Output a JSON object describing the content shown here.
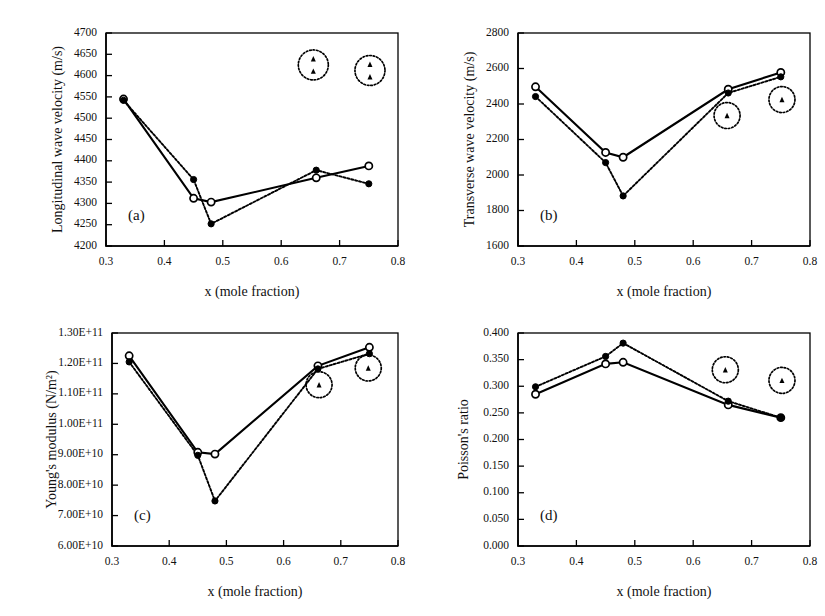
{
  "figure": {
    "background": "#ffffff",
    "ink_color": "#000000",
    "panel_count": 4
  },
  "chart_data": [
    {
      "id": "panel-a",
      "type": "line",
      "panel_label": "(a)",
      "title": "",
      "xlabel": "x (mole fraction)",
      "ylabel": "Longitudinal wave velocity (m/s)",
      "xlim": [
        0.3,
        0.8
      ],
      "ylim": [
        4200,
        4700
      ],
      "xticks": [
        0.3,
        0.4,
        0.5,
        0.6,
        0.7,
        0.8
      ],
      "xtick_labels": [
        "0.3",
        "0.4",
        "0.5",
        "0.6",
        "0.7",
        "0.8"
      ],
      "yticks": [
        4200,
        4250,
        4300,
        4350,
        4400,
        4450,
        4500,
        4550,
        4600,
        4650,
        4700
      ],
      "ytick_labels": [
        "4200",
        "4250",
        "4300",
        "4350",
        "4400",
        "4450",
        "4500",
        "4550",
        "4600",
        "4650",
        "4700"
      ],
      "grid": false,
      "legend": "none",
      "series": [
        {
          "name": "solid-open-circle",
          "style": "solid",
          "marker": "open-circle",
          "x": [
            0.33,
            0.45,
            0.48,
            0.66,
            0.75
          ],
          "values": [
            4545,
            4312,
            4303,
            4360,
            4388
          ]
        },
        {
          "name": "dotted-filled-diamond",
          "style": "dotted",
          "marker": "filled-diamond",
          "x": [
            0.33,
            0.45,
            0.48,
            0.66,
            0.75
          ],
          "values": [
            4542,
            4356,
            4252,
            4378,
            4346
          ]
        }
      ],
      "annotations": [
        {
          "type": "dotted-circle-with-triangles",
          "triangle_count": 2,
          "x": 0.655,
          "y": 4625
        },
        {
          "type": "dotted-circle-with-triangles",
          "triangle_count": 2,
          "x": 0.752,
          "y": 4612
        }
      ]
    },
    {
      "id": "panel-b",
      "type": "line",
      "panel_label": "(b)",
      "title": "",
      "xlabel": "x (mole fraction)",
      "ylabel": "Transverse wave velocity (m/s)",
      "xlim": [
        0.3,
        0.8
      ],
      "ylim": [
        1600,
        2800
      ],
      "xticks": [
        0.3,
        0.4,
        0.5,
        0.6,
        0.7,
        0.8
      ],
      "xtick_labels": [
        "0.3",
        "0.4",
        "0.5",
        "0.6",
        "0.7",
        "0.8"
      ],
      "yticks": [
        1600,
        1800,
        2000,
        2200,
        2400,
        2600,
        2800
      ],
      "ytick_labels": [
        "1600",
        "1800",
        "2000",
        "2200",
        "2400",
        "2600",
        "2800"
      ],
      "grid": false,
      "legend": "none",
      "series": [
        {
          "name": "solid-open-circle",
          "style": "solid",
          "marker": "open-circle",
          "x": [
            0.33,
            0.45,
            0.48,
            0.66,
            0.75
          ],
          "values": [
            2497,
            2127,
            2100,
            2483,
            2578
          ]
        },
        {
          "name": "dotted-filled-diamond",
          "style": "dotted",
          "marker": "filled-diamond",
          "x": [
            0.33,
            0.45,
            0.48,
            0.66,
            0.75
          ],
          "values": [
            2442,
            2070,
            1882,
            2462,
            2553
          ]
        }
      ],
      "annotations": [
        {
          "type": "dotted-circle-with-triangles",
          "triangle_count": 1,
          "x": 0.658,
          "y": 2335
        },
        {
          "type": "dotted-circle-with-triangles",
          "triangle_count": 1,
          "x": 0.752,
          "y": 2425
        }
      ]
    },
    {
      "id": "panel-c",
      "type": "line",
      "panel_label": "(c)",
      "title": "",
      "xlabel": "x (mole fraction)",
      "ylabel": "Young's modulus (N/m²)",
      "xlim": [
        0.3,
        0.8
      ],
      "ylim": [
        60000000000,
        130000000000
      ],
      "xticks": [
        0.3,
        0.4,
        0.5,
        0.6,
        0.7,
        0.8
      ],
      "xtick_labels": [
        "0.3",
        "0.4",
        "0.5",
        "0.6",
        "0.7",
        "0.8"
      ],
      "yticks": [
        60000000000,
        70000000000,
        80000000000,
        90000000000,
        100000000000,
        110000000000,
        120000000000,
        130000000000
      ],
      "ytick_labels": [
        "6.00E+10",
        "7.00E+10",
        "8.00E+10",
        "9.00E+10",
        "1.00E+11",
        "1.10E+11",
        "1.20E+11",
        "1.30E+11"
      ],
      "grid": false,
      "legend": "none",
      "series": [
        {
          "name": "solid-open-circle",
          "style": "solid",
          "marker": "open-circle",
          "x": [
            0.33,
            0.45,
            0.48,
            0.66,
            0.75
          ],
          "values": [
            122500000000,
            90800000000,
            90200000000,
            119200000000,
            125300000000
          ]
        },
        {
          "name": "dotted-filled-diamond",
          "style": "dotted",
          "marker": "filled-diamond",
          "x": [
            0.33,
            0.45,
            0.48,
            0.66,
            0.75
          ],
          "values": [
            120500000000,
            89800000000,
            74800000000,
            118200000000,
            123200000000
          ]
        }
      ],
      "annotations": [
        {
          "type": "dotted-circle-with-triangles",
          "triangle_count": 1,
          "x": 0.662,
          "y": 113000000000
        },
        {
          "type": "dotted-circle-with-triangles",
          "triangle_count": 1,
          "x": 0.748,
          "y": 118500000000
        }
      ]
    },
    {
      "id": "panel-d",
      "type": "line",
      "panel_label": "(d)",
      "title": "",
      "xlabel": "x (mole fraction)",
      "ylabel": "Poisson's ratio",
      "xlim": [
        0.3,
        0.8
      ],
      "ylim": [
        0.0,
        0.4
      ],
      "xticks": [
        0.3,
        0.4,
        0.5,
        0.6,
        0.7,
        0.8
      ],
      "xtick_labels": [
        "0.3",
        "0.4",
        "0.5",
        "0.6",
        "0.7",
        "0.8"
      ],
      "yticks": [
        0.0,
        0.05,
        0.1,
        0.15,
        0.2,
        0.25,
        0.3,
        0.35,
        0.4
      ],
      "ytick_labels": [
        "0.000",
        "0.050",
        "0.100",
        "0.150",
        "0.200",
        "0.250",
        "0.300",
        "0.350",
        "0.400"
      ],
      "grid": false,
      "legend": "none",
      "series": [
        {
          "name": "solid-open-circle",
          "style": "solid",
          "marker": "open-circle",
          "x": [
            0.33,
            0.45,
            0.48,
            0.66,
            0.75
          ],
          "values": [
            0.285,
            0.342,
            0.345,
            0.265,
            0.241
          ]
        },
        {
          "name": "dotted-filled-diamond",
          "style": "dotted",
          "marker": "filled-diamond",
          "x": [
            0.33,
            0.45,
            0.48,
            0.66,
            0.75
          ],
          "values": [
            0.299,
            0.356,
            0.381,
            0.272,
            0.241
          ]
        }
      ],
      "annotations": [
        {
          "type": "dotted-circle-with-triangles",
          "triangle_count": 1,
          "x": 0.655,
          "y": 0.331
        },
        {
          "type": "dotted-circle-with-triangles",
          "triangle_count": 1,
          "x": 0.752,
          "y": 0.311
        }
      ]
    }
  ]
}
